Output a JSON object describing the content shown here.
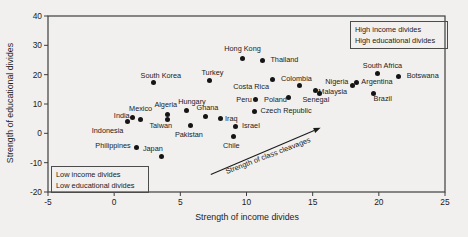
{
  "chart_data": {
    "type": "scatter",
    "title": "",
    "xlabel": "Strength of income divides",
    "ylabel": "Strength of educational divides",
    "xlim": [
      -5,
      25
    ],
    "ylim": [
      -20,
      40
    ],
    "xticks": [
      -5,
      0,
      5,
      10,
      15,
      20,
      25
    ],
    "yticks": [
      40,
      30,
      20,
      10,
      0,
      -10,
      -20
    ],
    "grid": false,
    "marker_color": "#151515",
    "frame_color": "#3e3e3e",
    "points": [
      {
        "label": "Hong Kong",
        "x": 9.7,
        "y": 25.5,
        "lp": "above",
        "dx": 0,
        "dy": -2
      },
      {
        "label": "Thailand",
        "x": 11.2,
        "y": 24.9,
        "lp": "right",
        "dx": 2,
        "dy": 0
      },
      {
        "label": "South Korea",
        "x": 3.0,
        "y": 17.5,
        "lp": "above",
        "dx": 7,
        "dy": 2
      },
      {
        "label": "Turkey",
        "x": 7.2,
        "y": 18.1,
        "lp": "above",
        "dx": 3,
        "dy": 1
      },
      {
        "label": "Costa Rica",
        "x": 12.0,
        "y": 18.2,
        "lp": "below-left",
        "dx": -6,
        "dy": 0
      },
      {
        "label": "Colombia",
        "x": 14.0,
        "y": 16.2,
        "lp": "above",
        "dx": -3,
        "dy": 1
      },
      {
        "label": "Malaysia",
        "x": 15.2,
        "y": 14.5,
        "lp": "right",
        "dx": -3,
        "dy": 1
      },
      {
        "label": "Senegal",
        "x": 15.5,
        "y": 13.6,
        "lp": "below-left",
        "dx": 8,
        "dy": 0
      },
      {
        "label": "Nigeria",
        "x": 18.0,
        "y": 16.3,
        "lp": "left",
        "dx": 2,
        "dy": -4
      },
      {
        "label": "Argentina",
        "x": 18.3,
        "y": 17.5,
        "lp": "right",
        "dx": -1,
        "dy": 0
      },
      {
        "label": "South Africa",
        "x": 19.9,
        "y": 20.5,
        "lp": "above",
        "dx": 5,
        "dy": 1
      },
      {
        "label": "Botswana",
        "x": 21.5,
        "y": 19.4,
        "lp": "right",
        "dx": 2,
        "dy": 0
      },
      {
        "label": "Brazil",
        "x": 19.6,
        "y": 13.6,
        "lp": "below-right",
        "dx": -4,
        "dy": 0
      },
      {
        "label": "Peru",
        "x": 10.7,
        "y": 11.4,
        "lp": "left",
        "dx": 2,
        "dy": 0
      },
      {
        "label": "Poland",
        "x": 13.2,
        "y": 12.2,
        "lp": "left",
        "dx": 4,
        "dy": 2
      },
      {
        "label": "Czech Republic",
        "x": 10.6,
        "y": 7.4,
        "lp": "right",
        "dx": 0,
        "dy": -1
      },
      {
        "label": "Israel",
        "x": 9.2,
        "y": 2.5,
        "lp": "right",
        "dx": 0,
        "dy": 0
      },
      {
        "label": "Chile",
        "x": 9.0,
        "y": -1.0,
        "lp": "below",
        "dx": -2,
        "dy": 2
      },
      {
        "label": "Iraq",
        "x": 8.0,
        "y": 4.9,
        "lp": "right",
        "dx": -1,
        "dy": 0
      },
      {
        "label": "Ghana",
        "x": 6.9,
        "y": 5.9,
        "lp": "above",
        "dx": 2,
        "dy": 0
      },
      {
        "label": "Pakistan",
        "x": 5.8,
        "y": 2.6,
        "lp": "below",
        "dx": -2,
        "dy": 1
      },
      {
        "label": "Hungary",
        "x": 5.5,
        "y": 7.8,
        "lp": "above",
        "dx": 5,
        "dy": 0
      },
      {
        "label": "Algeria",
        "x": 4.0,
        "y": 6.5,
        "lp": "above-left",
        "dx": 8,
        "dy": -2
      },
      {
        "label": "Taiwan",
        "x": 4.0,
        "y": 4.8,
        "lp": "below-left",
        "dx": 3,
        "dy": 0
      },
      {
        "label": "Mexico",
        "x": 2.0,
        "y": 4.6,
        "lp": "above",
        "dx": 0,
        "dy": -3
      },
      {
        "label": "India",
        "x": 1.4,
        "y": 5.3,
        "lp": "left",
        "dx": 3,
        "dy": -2
      },
      {
        "label": "Indonesia",
        "x": 1.0,
        "y": 4.2,
        "lp": "below-left",
        "dx": -6,
        "dy": 3
      },
      {
        "label": "Philippines",
        "x": 1.7,
        "y": -4.8,
        "lp": "left",
        "dx": 0,
        "dy": -1
      },
      {
        "label": "Japan",
        "x": 3.6,
        "y": -8.0,
        "lp": "above-left",
        "dx": -1,
        "dy": -1
      }
    ],
    "annotations": {
      "high_box_line1": "High income divides",
      "high_box_line2": "High educational divides",
      "low_box_line1": "Low income divides",
      "low_box_line2": "Low educational divides",
      "arrow_label": "Strength of class cleavages",
      "arrow": {
        "x1": 7.3,
        "y1": -14.0,
        "x2": 15.6,
        "y2": 1.9
      }
    }
  }
}
